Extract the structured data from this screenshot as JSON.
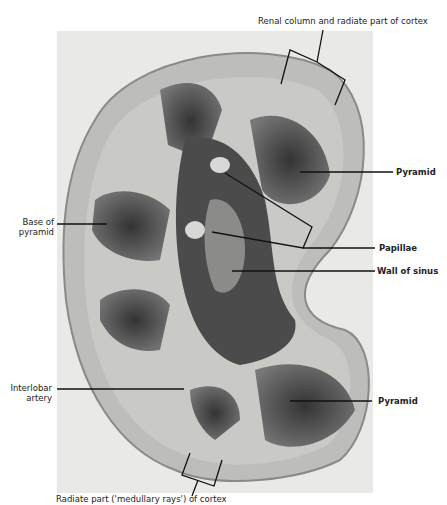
{
  "figure": {
    "labels": {
      "renal_column": "Renal column and radiate part of cortex",
      "pyramid_top": "Pyramid",
      "base_of_pyramid_line1": "Base of",
      "base_of_pyramid_line2": "pyramid",
      "papillae": "Papillae",
      "wall_of_sinus": "Wall of sinus",
      "interlobar_line1": "Interlobar",
      "interlobar_line2": "artery",
      "pyramid_bottom": "Pyramid",
      "radiate_part": "Radiate part ('medullary rays') of cortex"
    },
    "colors": {
      "background": "#ffffff",
      "photo_bg": "#e9e9e7",
      "cortex": "#b9b9b7",
      "pyramid": "#4a4a4a",
      "sinus": "#3a3a3a",
      "line": "#111111"
    }
  }
}
